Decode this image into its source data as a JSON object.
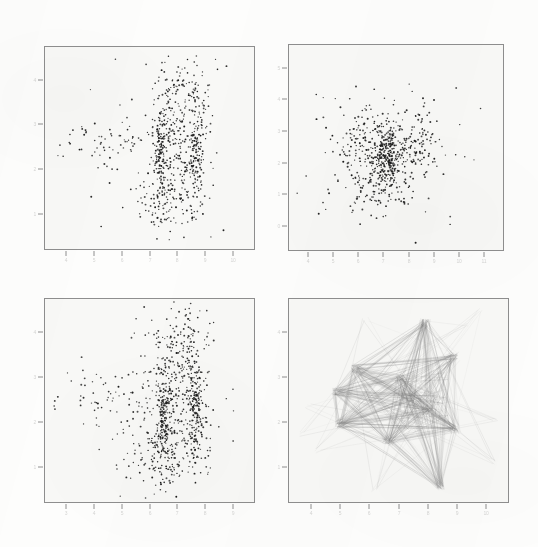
{
  "figure": {
    "background_color": "#fdfdfc",
    "panel_background_color": "#f8f8f6",
    "panel_border_color": "#8e8e8e",
    "marker_color": "#1a1a1a",
    "line_color": "#808080",
    "width": 538,
    "height": 547
  },
  "panels": [
    {
      "id": "panel-top-left",
      "position": "top-left",
      "kind": "scatter",
      "x": 44,
      "y": 46,
      "w": 211,
      "h": 204,
      "x_tick_labels": [
        "4",
        "5",
        "6",
        "7",
        "8",
        "9",
        "10"
      ],
      "y_tick_labels": [
        "4",
        "3",
        "2",
        "1"
      ],
      "x_tick_count": 7,
      "y_tick_count": 4
    },
    {
      "id": "panel-top-right",
      "position": "top-right",
      "kind": "scatter",
      "x": 288,
      "y": 44,
      "w": 216,
      "h": 207,
      "x_tick_labels": [
        "4",
        "5",
        "6",
        "7",
        "8",
        "9",
        "10",
        "11"
      ],
      "y_tick_labels": [
        "5",
        "4",
        "3",
        "2",
        "1",
        "0"
      ],
      "x_tick_count": 8,
      "y_tick_count": 6
    },
    {
      "id": "panel-bottom-left",
      "position": "bottom-left",
      "kind": "scatter",
      "x": 44,
      "y": 298,
      "w": 211,
      "h": 205,
      "x_tick_labels": [
        "3",
        "4",
        "5",
        "6",
        "7",
        "8",
        "9"
      ],
      "y_tick_labels": [
        "4",
        "3",
        "2",
        "1"
      ],
      "x_tick_count": 7,
      "y_tick_count": 4
    },
    {
      "id": "panel-bottom-right",
      "position": "bottom-right",
      "kind": "network",
      "x": 288,
      "y": 298,
      "w": 221,
      "h": 205,
      "x_tick_labels": [
        "4",
        "5",
        "6",
        "7",
        "8",
        "9",
        "10"
      ],
      "y_tick_labels": [
        "4",
        "3",
        "2",
        "1"
      ],
      "x_tick_count": 7,
      "y_tick_count": 4
    }
  ],
  "chart_data": [
    {
      "type": "scatter",
      "panel": "top-left",
      "title": "",
      "xlabel": "",
      "ylabel": "",
      "xlim": [
        0,
        1
      ],
      "ylim": [
        0,
        1
      ],
      "grid": false,
      "legend": null,
      "n_points": 760,
      "description": "Dense scatter with two strong vertical striations near x=0.55 and x=0.72 plus an upward plume toward x=0.62..0.80; sparse outliers to the left.",
      "clusters": [
        {
          "name": "column-a",
          "cx": 0.555,
          "cy": 0.48,
          "sx": 0.016,
          "sy": 0.115,
          "n": 130
        },
        {
          "name": "column-b",
          "cx": 0.72,
          "cy": 0.46,
          "sx": 0.016,
          "sy": 0.115,
          "n": 115
        },
        {
          "name": "plume",
          "cx": 0.66,
          "cy": 0.76,
          "sx": 0.075,
          "sy": 0.105,
          "n": 150
        },
        {
          "name": "core",
          "cx": 0.625,
          "cy": 0.46,
          "sx": 0.08,
          "sy": 0.145,
          "n": 190
        },
        {
          "name": "lower-skirt",
          "cx": 0.59,
          "cy": 0.22,
          "sx": 0.085,
          "sy": 0.08,
          "n": 95
        },
        {
          "name": "left-tail",
          "cx": 0.3,
          "cy": 0.52,
          "sx": 0.11,
          "sy": 0.07,
          "n": 55
        },
        {
          "name": "sparse-field",
          "cx": 0.5,
          "cy": 0.5,
          "sx": 0.26,
          "sy": 0.23,
          "n": 25
        }
      ]
    },
    {
      "type": "scatter",
      "panel": "top-right",
      "title": "",
      "xlabel": "",
      "ylabel": "",
      "xlim": [
        0,
        1
      ],
      "ylim": [
        0,
        1
      ],
      "grid": false,
      "legend": null,
      "n_points": 700,
      "description": "Diffuse roughly radial blob centered near (0.47,0.47) with vertical striations through the core and a broad scatter halo.",
      "clusters": [
        {
          "name": "core",
          "cx": 0.47,
          "cy": 0.47,
          "sx": 0.055,
          "sy": 0.075,
          "n": 180
        },
        {
          "name": "stria-1",
          "cx": 0.432,
          "cy": 0.47,
          "sx": 0.011,
          "sy": 0.085,
          "n": 70
        },
        {
          "name": "stria-2",
          "cx": 0.478,
          "cy": 0.47,
          "sx": 0.011,
          "sy": 0.085,
          "n": 70
        },
        {
          "name": "left-lobe",
          "cx": 0.32,
          "cy": 0.53,
          "sx": 0.055,
          "sy": 0.1,
          "n": 95
        },
        {
          "name": "right-lobe",
          "cx": 0.61,
          "cy": 0.52,
          "sx": 0.055,
          "sy": 0.085,
          "n": 85
        },
        {
          "name": "lower-lobe",
          "cx": 0.4,
          "cy": 0.3,
          "sx": 0.09,
          "sy": 0.075,
          "n": 90
        },
        {
          "name": "halo",
          "cx": 0.47,
          "cy": 0.47,
          "sx": 0.18,
          "sy": 0.175,
          "n": 110
        }
      ]
    },
    {
      "type": "scatter",
      "panel": "bottom-left",
      "title": "",
      "xlabel": "",
      "ylabel": "",
      "xlim": [
        0,
        1
      ],
      "ylim": [
        0,
        1
      ],
      "grid": false,
      "legend": null,
      "n_points": 900,
      "description": "Same structure as top-left but denser: two bold vertical striations near x=0.57 and x=0.72 with a tall upward plume and broad lower skirt.",
      "clusters": [
        {
          "name": "column-a",
          "cx": 0.57,
          "cy": 0.43,
          "sx": 0.017,
          "sy": 0.125,
          "n": 165
        },
        {
          "name": "column-b",
          "cx": 0.72,
          "cy": 0.47,
          "sx": 0.016,
          "sy": 0.115,
          "n": 140
        },
        {
          "name": "plume",
          "cx": 0.65,
          "cy": 0.76,
          "sx": 0.075,
          "sy": 0.11,
          "n": 175
        },
        {
          "name": "core",
          "cx": 0.63,
          "cy": 0.45,
          "sx": 0.085,
          "sy": 0.15,
          "n": 215
        },
        {
          "name": "lower-skirt",
          "cx": 0.58,
          "cy": 0.21,
          "sx": 0.095,
          "sy": 0.085,
          "n": 125
        },
        {
          "name": "left-tail",
          "cx": 0.3,
          "cy": 0.52,
          "sx": 0.115,
          "sy": 0.08,
          "n": 60
        },
        {
          "name": "sparse-field",
          "cx": 0.5,
          "cy": 0.5,
          "sx": 0.265,
          "sy": 0.24,
          "n": 20
        }
      ]
    },
    {
      "type": "network",
      "panel": "bottom-right",
      "title": "",
      "xlabel": "",
      "ylabel": "",
      "xlim": [
        0,
        1
      ],
      "ylim": [
        0,
        1
      ],
      "grid": false,
      "legend": null,
      "n_edges": 620,
      "description": "Star-burst network of thin overlapping straight line segments between hub nodes; densest overlap in the right-of-centre region, long rays reaching the panel corners.",
      "nodes": [
        {
          "id": 0,
          "x": 0.62,
          "y": 0.885,
          "hub": true
        },
        {
          "id": 1,
          "x": 0.755,
          "y": 0.72,
          "hub": true
        },
        {
          "id": 2,
          "x": 0.3,
          "y": 0.66,
          "hub": true
        },
        {
          "id": 3,
          "x": 0.215,
          "y": 0.545,
          "hub": true
        },
        {
          "id": 4,
          "x": 0.23,
          "y": 0.38,
          "hub": true
        },
        {
          "id": 5,
          "x": 0.45,
          "y": 0.3,
          "hub": true
        },
        {
          "id": 6,
          "x": 0.69,
          "y": 0.075,
          "hub": true
        },
        {
          "id": 7,
          "x": 0.76,
          "y": 0.36,
          "hub": true
        },
        {
          "id": 8,
          "x": 0.56,
          "y": 0.52,
          "hub": true
        },
        {
          "id": 9,
          "x": 0.64,
          "y": 0.45,
          "hub": true
        },
        {
          "id": 10,
          "x": 0.505,
          "y": 0.61,
          "hub": true
        },
        {
          "id": 11,
          "x": 0.87,
          "y": 0.94,
          "hub": false
        },
        {
          "id": 12,
          "x": 0.085,
          "y": 0.47,
          "hub": false
        },
        {
          "id": 13,
          "x": 0.94,
          "y": 0.415,
          "hub": false
        },
        {
          "id": 14,
          "x": 0.39,
          "y": 0.06,
          "hub": false
        },
        {
          "id": 15,
          "x": 0.93,
          "y": 0.2,
          "hub": false
        },
        {
          "id": 16,
          "x": 0.13,
          "y": 0.25,
          "hub": false
        },
        {
          "id": 17,
          "x": 0.82,
          "y": 0.87,
          "hub": false
        },
        {
          "id": 18,
          "x": 0.35,
          "y": 0.905,
          "hub": false
        },
        {
          "id": 19,
          "x": 0.06,
          "y": 0.33,
          "hub": false
        }
      ]
    }
  ]
}
